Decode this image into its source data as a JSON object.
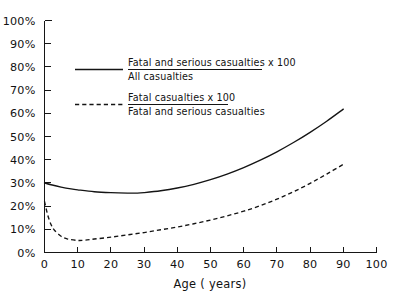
{
  "chart_data": {
    "type": "line",
    "title": "",
    "xlabel": "Age ( years)",
    "ylabel": "",
    "xlim": [
      0,
      100
    ],
    "ylim": [
      0,
      100
    ],
    "grid": false,
    "legend_position": "upper-left-inside",
    "x_ticks": [
      0,
      10,
      20,
      30,
      40,
      50,
      60,
      70,
      80,
      90,
      100
    ],
    "x_tick_labels": [
      "0",
      "10",
      "20",
      "30",
      "40",
      "50",
      "60",
      "70",
      "80",
      "90",
      "100"
    ],
    "y_ticks": [
      0,
      10,
      20,
      30,
      40,
      50,
      60,
      70,
      80,
      90,
      100
    ],
    "y_tick_labels": [
      "0%",
      "10%",
      "20%",
      "30%",
      "40%",
      "50%",
      "60%",
      "70%",
      "80%",
      "90%",
      "100%"
    ],
    "series": [
      {
        "name": "Fatal and serious casualties x 100 / All casualties",
        "style": "solid",
        "color": "#141414",
        "numerator": "Fatal and serious casualties x 100",
        "denominator": "All casualties",
        "x": [
          0,
          2,
          5,
          8,
          10,
          15,
          20,
          25,
          28,
          30,
          35,
          40,
          45,
          50,
          55,
          60,
          65,
          70,
          75,
          80,
          85,
          90
        ],
        "y": [
          30.0,
          29.2,
          28.2,
          27.4,
          27.0,
          26.2,
          25.8,
          25.6,
          25.6,
          25.8,
          26.6,
          27.8,
          29.4,
          31.4,
          33.8,
          36.6,
          39.8,
          43.4,
          47.4,
          51.8,
          56.6,
          61.8
        ]
      },
      {
        "name": "Fatal casualties x 100 / Fatal and serious casualties",
        "style": "dashed",
        "color": "#141414",
        "numerator": "Fatal casualties x 100",
        "denominator": "Fatal and serious casualties",
        "x": [
          0,
          1,
          2,
          3,
          5,
          7,
          10,
          12,
          15,
          20,
          25,
          30,
          35,
          40,
          45,
          50,
          55,
          60,
          65,
          70,
          75,
          80,
          85,
          90
        ],
        "y": [
          22.0,
          16.0,
          12.0,
          9.6,
          7.0,
          5.8,
          5.2,
          5.3,
          5.8,
          6.6,
          7.6,
          8.6,
          9.8,
          11.0,
          12.4,
          14.0,
          15.8,
          17.8,
          20.2,
          23.0,
          26.2,
          29.8,
          33.8,
          38.0
        ]
      }
    ]
  },
  "legend": {
    "entries": [
      {
        "sample": "solid-line-sample",
        "numerator": "Fatal and serious casualties x 100",
        "denominator": "All casualties"
      },
      {
        "sample": "dashed-line-sample",
        "numerator": "Fatal casualties x 100",
        "denominator": "Fatal and serious casualties"
      }
    ]
  },
  "axes": {
    "x_title": "Age ( years)"
  }
}
